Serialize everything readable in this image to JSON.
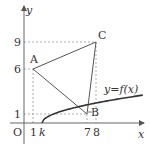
{
  "diagram": {
    "axes": {
      "x_label": "x",
      "y_label": "y",
      "origin_label": "O"
    },
    "ticks": {
      "x": [
        {
          "value": 1,
          "label": "1"
        },
        {
          "value": 2,
          "label": "k"
        },
        {
          "value": 7,
          "label": "7"
        },
        {
          "value": 8,
          "label": "8"
        }
      ],
      "y": [
        {
          "value": 1,
          "label": "1"
        },
        {
          "value": 6,
          "label": "6"
        },
        {
          "value": 9,
          "label": "9"
        }
      ]
    },
    "points": [
      {
        "name": "A",
        "x": 1,
        "y": 6
      },
      {
        "name": "B",
        "x": 7,
        "y": 1
      },
      {
        "name": "C",
        "x": 8,
        "y": 9
      }
    ],
    "curve": {
      "label": "y=f(x)",
      "start_x_label": "k"
    },
    "colors": {
      "line": "#555555",
      "curve": "#333333",
      "dashed": "#999999",
      "text": "#333333"
    }
  }
}
